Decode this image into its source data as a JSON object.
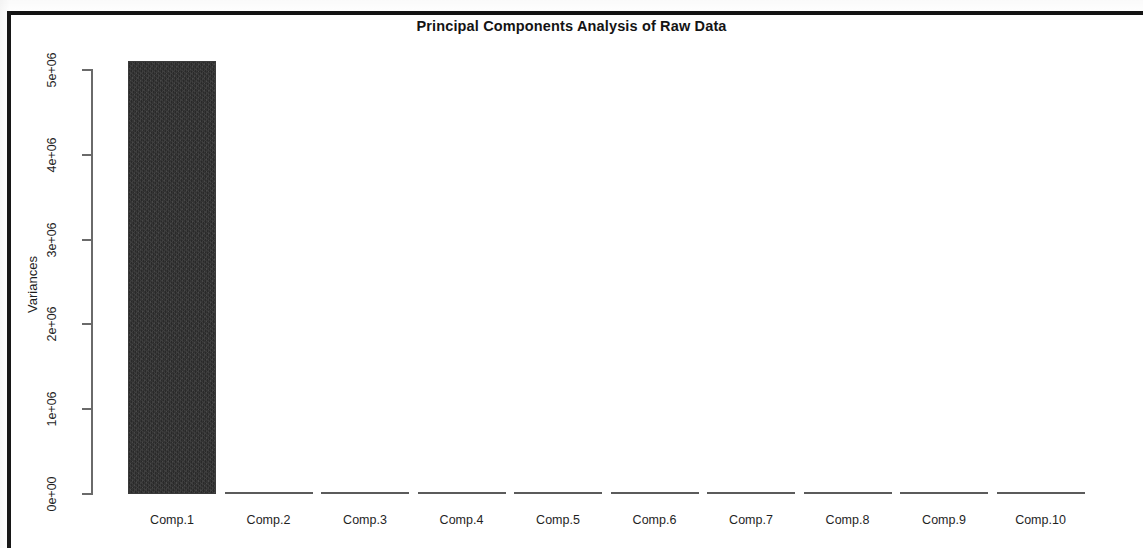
{
  "document": {
    "kind": "scanned-figure-page",
    "frame_color": "#141414"
  },
  "chart_data": {
    "type": "bar",
    "title": "Principal Components Analysis of Raw Data",
    "xlabel": "",
    "ylabel": "Variances",
    "categories": [
      "Comp.1",
      "Comp.2",
      "Comp.3",
      "Comp.4",
      "Comp.5",
      "Comp.6",
      "Comp.7",
      "Comp.8",
      "Comp.9",
      "Comp.10"
    ],
    "values": [
      5110000,
      14000,
      11000,
      9000,
      7500,
      6000,
      5000,
      4000,
      3000,
      2000
    ],
    "ylim": [
      0,
      5110000
    ],
    "ytick_values": [
      0,
      1000000,
      2000000,
      3000000,
      4000000,
      5000000
    ],
    "ytick_labels": [
      "0e+00",
      "1e+06",
      "2e+06",
      "3e+06",
      "4e+06",
      "5e+06"
    ],
    "grid": false,
    "legend": null,
    "bar_color": "#2e2e2e"
  },
  "axis": {
    "y_title": "Variances"
  }
}
